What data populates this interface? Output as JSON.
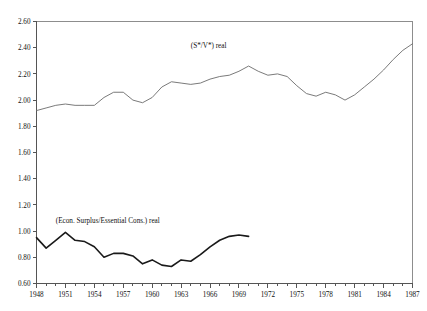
{
  "chart_data": {
    "type": "line",
    "title": "",
    "subtitle": "",
    "xlabel": "",
    "ylabel": "",
    "xlim": [
      1948,
      1987
    ],
    "ylim": [
      0.6,
      2.6
    ],
    "grid": false,
    "legend_position": "inline-annotation",
    "y_ticks": [
      "2.60",
      "2.40",
      "2.20",
      "2.00",
      "1.80",
      "1.60",
      "1.40",
      "1.20",
      "1.00",
      "0.80",
      "0.60"
    ],
    "y_tick_values": [
      2.6,
      2.4,
      2.2,
      2.0,
      1.8,
      1.6,
      1.4,
      1.2,
      1.0,
      0.8,
      0.6
    ],
    "x_ticks": [
      "1948",
      "1951",
      "1954",
      "1957",
      "1960",
      "1963",
      "1966",
      "1969",
      "1972",
      "1975",
      "1978",
      "1981",
      "1984",
      "1987"
    ],
    "x_tick_values": [
      1948,
      1951,
      1954,
      1957,
      1960,
      1963,
      1966,
      1969,
      1972,
      1975,
      1978,
      1981,
      1984,
      1987
    ],
    "x_minor_step": 1,
    "series": [
      {
        "name": "(S*/V*) real",
        "annotation": "(S*/V*) real",
        "annotation_x": 1964,
        "annotation_y": 2.4,
        "style": "thin",
        "color": "#6b6b6b",
        "x": [
          1948,
          1949,
          1950,
          1951,
          1952,
          1953,
          1954,
          1955,
          1956,
          1957,
          1958,
          1959,
          1960,
          1961,
          1962,
          1963,
          1964,
          1965,
          1966,
          1967,
          1968,
          1969,
          1970,
          1971,
          1972,
          1973,
          1974,
          1975,
          1976,
          1977,
          1978,
          1979,
          1980,
          1981,
          1982,
          1983,
          1984,
          1985,
          1986,
          1987
        ],
        "values": [
          1.92,
          1.94,
          1.96,
          1.97,
          1.96,
          1.96,
          1.96,
          2.02,
          2.06,
          2.06,
          2.0,
          1.98,
          2.02,
          2.1,
          2.14,
          2.13,
          2.12,
          2.13,
          2.16,
          2.18,
          2.19,
          2.22,
          2.26,
          2.22,
          2.19,
          2.2,
          2.18,
          2.11,
          2.05,
          2.03,
          2.06,
          2.04,
          2.0,
          2.04,
          2.1,
          2.16,
          2.23,
          2.31,
          2.38,
          2.43
        ]
      },
      {
        "name": "(Econ. Surplus/Essential Cons.) real",
        "annotation": "(Econ. Surplus/Essential Cons.) real",
        "annotation_x": 1950,
        "annotation_y": 1.06,
        "style": "thick",
        "color": "#1a1a1a",
        "x": [
          1948,
          1949,
          1950,
          1951,
          1952,
          1953,
          1954,
          1955,
          1956,
          1957,
          1958,
          1959,
          1960,
          1961,
          1962,
          1963,
          1964,
          1965,
          1966,
          1967,
          1968,
          1969,
          1970
        ],
        "values": [
          0.95,
          0.87,
          0.93,
          0.99,
          0.93,
          0.92,
          0.88,
          0.8,
          0.83,
          0.83,
          0.81,
          0.75,
          0.78,
          0.74,
          0.73,
          0.78,
          0.77,
          0.82,
          0.88,
          0.93,
          0.96,
          0.97,
          0.96
        ]
      }
    ]
  }
}
